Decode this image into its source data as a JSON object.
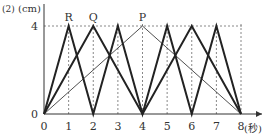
{
  "chart_data": {
    "type": "line",
    "problem_label": "(2)",
    "ylabel": "(cm)",
    "xlabel": "(秒)",
    "xlim": [
      0,
      8
    ],
    "ylim": [
      0,
      4
    ],
    "x_ticks": [
      0,
      1,
      2,
      3,
      4,
      5,
      6,
      7,
      8
    ],
    "y_ticks": [
      0,
      4
    ],
    "grid": "dotted verticals at each integer x, dotted horizontal at y=4",
    "series": [
      {
        "name": "R",
        "style": "thick",
        "x": [
          0,
          1,
          2,
          3,
          4,
          5,
          6,
          7,
          8
        ],
        "y": [
          0,
          4,
          0,
          4,
          0,
          4,
          0,
          4,
          0
        ]
      },
      {
        "name": "Q",
        "style": "thick",
        "x": [
          0,
          2,
          4,
          6,
          8
        ],
        "y": [
          0,
          4,
          0,
          4,
          0
        ]
      },
      {
        "name": "P",
        "style": "thin",
        "x": [
          0,
          4,
          8
        ],
        "y": [
          0,
          4,
          0
        ]
      }
    ],
    "point_labels": [
      {
        "text": "R",
        "x": 1,
        "y": 4
      },
      {
        "text": "Q",
        "x": 2,
        "y": 4
      },
      {
        "text": "P",
        "x": 4,
        "y": 4
      }
    ]
  },
  "colors": {
    "line": "#222222",
    "grid": "#888888",
    "axis": "#333333"
  }
}
